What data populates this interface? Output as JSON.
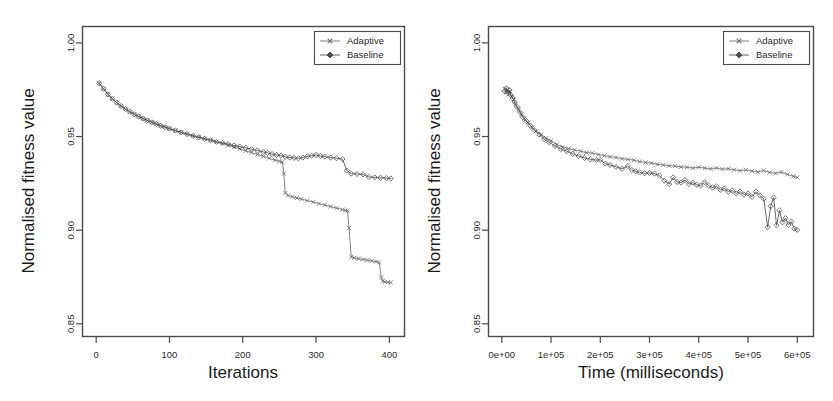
{
  "figure": {
    "background_color": "#ffffff",
    "panel_count": 2
  },
  "chart_data": [
    {
      "type": "line",
      "panel": "left",
      "title": "",
      "xlabel": "Iterations",
      "ylabel": "Normalised fitness value",
      "xlim": [
        -18,
        420
      ],
      "ylim": [
        0.8435,
        1.0085
      ],
      "xticks": [
        0,
        100,
        200,
        300,
        400
      ],
      "xticklabels": [
        "0",
        "100",
        "200",
        "300",
        "400"
      ],
      "yticks": [
        0.85,
        0.9,
        0.95,
        1.0
      ],
      "yticklabels": [
        "0.85",
        "0.90",
        "0.95",
        "1.00"
      ],
      "grid": false,
      "legend_position": "top-right",
      "legend": [
        "Adaptive",
        "Baseline"
      ],
      "series": [
        {
          "name": "Adaptive",
          "marker": "x",
          "color": "#6e6e6e",
          "x": [
            4,
            10,
            16,
            22,
            28,
            34,
            40,
            46,
            52,
            58,
            64,
            70,
            76,
            82,
            88,
            94,
            100,
            108,
            116,
            124,
            132,
            140,
            148,
            156,
            164,
            172,
            180,
            188,
            196,
            204,
            212,
            220,
            228,
            236,
            244,
            250,
            254,
            256,
            258,
            262,
            268,
            274,
            280,
            288,
            296,
            304,
            312,
            320,
            328,
            336,
            340,
            343,
            345,
            348,
            352,
            358,
            364,
            370,
            376,
            382,
            386,
            389,
            391,
            394,
            398,
            402
          ],
          "y": [
            0.9785,
            0.9755,
            0.9725,
            0.9702,
            0.9681,
            0.9663,
            0.9647,
            0.9632,
            0.9619,
            0.9607,
            0.9596,
            0.9586,
            0.9576,
            0.9567,
            0.9558,
            0.955,
            0.9542,
            0.9532,
            0.9522,
            0.9513,
            0.9504,
            0.9496,
            0.9488,
            0.948,
            0.9472,
            0.9463,
            0.9454,
            0.9444,
            0.9434,
            0.9424,
            0.9414,
            0.9404,
            0.9394,
            0.9384,
            0.9374,
            0.9368,
            0.9365,
            0.9302,
            0.9198,
            0.9185,
            0.9178,
            0.9172,
            0.9166,
            0.9158,
            0.915,
            0.9142,
            0.9134,
            0.9126,
            0.9118,
            0.911,
            0.9106,
            0.9104,
            0.9012,
            0.8858,
            0.8852,
            0.8848,
            0.8844,
            0.884,
            0.8836,
            0.8832,
            0.8828,
            0.8748,
            0.8728,
            0.8724,
            0.8722,
            0.872
          ]
        },
        {
          "name": "Baseline",
          "marker": "diamond",
          "color": "#4f4f4f",
          "x": [
            4,
            10,
            16,
            22,
            28,
            34,
            40,
            46,
            52,
            58,
            64,
            70,
            76,
            82,
            88,
            94,
            100,
            108,
            116,
            124,
            132,
            140,
            148,
            156,
            164,
            172,
            180,
            188,
            196,
            204,
            212,
            220,
            228,
            234,
            240,
            246,
            252,
            258,
            264,
            270,
            276,
            282,
            288,
            294,
            300,
            306,
            312,
            320,
            328,
            336,
            342,
            348,
            356,
            364,
            372,
            380,
            388,
            396,
            402
          ],
          "y": [
            0.9785,
            0.9755,
            0.9725,
            0.9702,
            0.9681,
            0.9663,
            0.9647,
            0.9632,
            0.9619,
            0.9607,
            0.9596,
            0.9586,
            0.9576,
            0.9567,
            0.9558,
            0.955,
            0.9542,
            0.9532,
            0.9522,
            0.9513,
            0.9504,
            0.9496,
            0.9488,
            0.948,
            0.9472,
            0.9466,
            0.946,
            0.9452,
            0.9446,
            0.944,
            0.9432,
            0.9426,
            0.9418,
            0.9412,
            0.9406,
            0.9402,
            0.9398,
            0.9392,
            0.9388,
            0.9386,
            0.9384,
            0.9388,
            0.9394,
            0.9398,
            0.9402,
            0.9396,
            0.9392,
            0.9388,
            0.9384,
            0.938,
            0.9318,
            0.9302,
            0.93,
            0.9298,
            0.9284,
            0.9282,
            0.928,
            0.9278,
            0.9276
          ]
        }
      ]
    },
    {
      "type": "line",
      "panel": "right",
      "title": "",
      "xlabel": "Time (milliseconds)",
      "ylabel": "Normalised fitness value",
      "xlim": [
        -26000,
        632000
      ],
      "ylim": [
        0.8435,
        1.0085
      ],
      "xticks": [
        0,
        100000,
        200000,
        300000,
        400000,
        500000,
        600000
      ],
      "xticklabels": [
        "0e+00",
        "1e+05",
        "2e+05",
        "3e+05",
        "4e+05",
        "5e+05",
        "6e+05"
      ],
      "yticks": [
        0.85,
        0.9,
        0.95,
        1.0
      ],
      "yticklabels": [
        "0.85",
        "0.90",
        "0.95",
        "1.00"
      ],
      "grid": false,
      "legend_position": "top-right",
      "legend": [
        "Adaptive",
        "Baseline"
      ],
      "series": [
        {
          "name": "Adaptive",
          "marker": "x",
          "color": "#6e6e6e",
          "x": [
            6000,
            9000,
            12000,
            14000,
            17000,
            20000,
            24000,
            28000,
            34000,
            40000,
            46000,
            54000,
            62000,
            70000,
            80000,
            90000,
            100000,
            112000,
            124000,
            136000,
            148000,
            160000,
            172000,
            184000,
            196000,
            208000,
            220000,
            232000,
            244000,
            256000,
            268000,
            280000,
            292000,
            304000,
            316000,
            328000,
            340000,
            352000,
            364000,
            376000,
            388000,
            400000,
            412000,
            424000,
            436000,
            448000,
            460000,
            472000,
            484000,
            496000,
            508000,
            520000,
            532000,
            544000,
            556000,
            568000,
            580000,
            592000,
            600000
          ],
          "y": [
            0.9755,
            0.9735,
            0.9748,
            0.9726,
            0.9742,
            0.9712,
            0.9698,
            0.9672,
            0.9645,
            0.9618,
            0.9596,
            0.9572,
            0.9548,
            0.9528,
            0.951,
            0.9492,
            0.9478,
            0.9458,
            0.9444,
            0.9436,
            0.9428,
            0.9422,
            0.9414,
            0.9412,
            0.9404,
            0.9398,
            0.9392,
            0.9388,
            0.9382,
            0.9378,
            0.9374,
            0.9366,
            0.9362,
            0.9358,
            0.9352,
            0.9348,
            0.9344,
            0.9342,
            0.9338,
            0.9336,
            0.9332,
            0.9336,
            0.9332,
            0.9328,
            0.9332,
            0.9326,
            0.9328,
            0.9322,
            0.9318,
            0.9322,
            0.9316,
            0.9312,
            0.9318,
            0.9308,
            0.9304,
            0.931,
            0.9298,
            0.9288,
            0.9282
          ]
        },
        {
          "name": "Baseline",
          "marker": "diamond",
          "color": "#4f4f4f",
          "x": [
            6000,
            9000,
            12000,
            15000,
            18000,
            22000,
            26000,
            31000,
            37000,
            43000,
            50000,
            58000,
            66000,
            76000,
            86000,
            96000,
            108000,
            120000,
            132000,
            144000,
            156000,
            168000,
            180000,
            192000,
            200000,
            210000,
            220000,
            232000,
            244000,
            256000,
            264000,
            272000,
            280000,
            290000,
            300000,
            310000,
            320000,
            330000,
            340000,
            348000,
            356000,
            364000,
            372000,
            380000,
            388000,
            396000,
            404000,
            412000,
            420000,
            428000,
            436000,
            444000,
            452000,
            460000,
            468000,
            476000,
            484000,
            492000,
            500000,
            508000,
            516000,
            524000,
            532000,
            540000,
            546000,
            552000,
            558000,
            564000,
            570000,
            576000,
            582000,
            588000,
            594000,
            600000
          ],
          "y": [
            0.9742,
            0.9758,
            0.9735,
            0.9748,
            0.9722,
            0.9706,
            0.9684,
            0.9658,
            0.963,
            0.9604,
            0.9582,
            0.9558,
            0.9534,
            0.951,
            0.9486,
            0.947,
            0.945,
            0.9434,
            0.9422,
            0.9408,
            0.9396,
            0.9386,
            0.9378,
            0.9374,
            0.9376,
            0.9356,
            0.9348,
            0.9338,
            0.9328,
            0.9342,
            0.9322,
            0.9314,
            0.9308,
            0.9304,
            0.9306,
            0.9302,
            0.9292,
            0.9264,
            0.9246,
            0.9282,
            0.9258,
            0.9254,
            0.9268,
            0.9246,
            0.9254,
            0.9242,
            0.9238,
            0.9256,
            0.9238,
            0.9228,
            0.9234,
            0.9216,
            0.9222,
            0.9206,
            0.9212,
            0.9196,
            0.9206,
            0.919,
            0.9196,
            0.9178,
            0.9206,
            0.9186,
            0.9168,
            0.9016,
            0.9128,
            0.9174,
            0.9026,
            0.9106,
            0.9042,
            0.9064,
            0.9028,
            0.9046,
            0.9008,
            0.9002
          ]
        }
      ]
    }
  ]
}
